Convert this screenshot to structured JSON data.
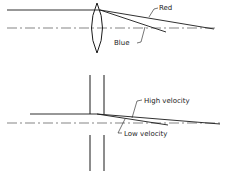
{
  "top_diagram": {
    "title": "Lens chromatic dispersion",
    "labels": {
      "red": "Red",
      "blue": "Blue"
    }
  },
  "bottom_diagram": {
    "title": "Slit velocity dispersion",
    "labels": {
      "high": "High velocity",
      "low": "Low velocity"
    }
  },
  "colors": {
    "line": "#1a1a1a",
    "background": "#ffffff"
  }
}
